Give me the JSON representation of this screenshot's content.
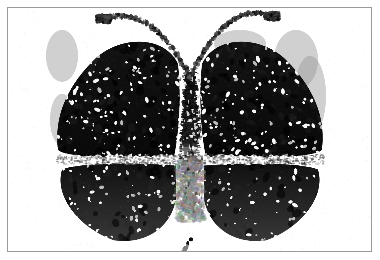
{
  "image": {
    "subject": "butterfly",
    "medium": "black-and-white photograph",
    "caption": "",
    "width": 380,
    "height": 260,
    "background_color": "#ffffff",
    "frame": {
      "border_color": "#9a9a9a",
      "border_width": 1,
      "inset_left": 7,
      "inset_top": 7,
      "frame_width": 365,
      "frame_height": 245
    },
    "palette": {
      "ink_black": "#0a0a0a",
      "wing_dark": "#141414",
      "wing_mid_gray": "#3c3c3c",
      "smudge_gray": "#7d7d7d",
      "pale_gray": "#b9b9b9",
      "paper_white": "#ffffff",
      "speck_white": "#f8f8f8"
    },
    "subject_parts": [
      "left-upper-wing",
      "right-upper-wing",
      "left-lower-wing",
      "right-lower-wing",
      "body",
      "left-antenna",
      "right-antenna",
      "white-separating-band"
    ],
    "geometry": {
      "body_center_x": 190,
      "body_top_y": 72,
      "body_bottom_y": 216,
      "body_half_width": 9,
      "upper_wing_top_y": 38,
      "wing_band_y": 160,
      "lower_wing_bottom_y": 241,
      "left_wing_outer_x": 56,
      "right_wing_outer_x": 324,
      "antenna_left_tip": [
        104,
        19
      ],
      "antenna_right_tip": [
        272,
        16
      ],
      "antenna_join": [
        190,
        78
      ]
    },
    "texture": {
      "speck_count": 520,
      "edge_blob_count": 1400,
      "noise_seed": 20240607,
      "speck_min_radius": 0.5,
      "speck_max_radius": 1.9
    }
  }
}
